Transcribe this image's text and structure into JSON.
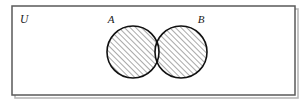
{
  "figure": {
    "type": "venn-diagram",
    "title": "",
    "universe_label": "U",
    "sets": [
      {
        "id": "A",
        "label": "A",
        "shaded": true
      },
      {
        "id": "B",
        "label": "B",
        "shaded": true
      }
    ],
    "regions": {
      "a_only": {
        "name": "A only",
        "shaded": true,
        "fill": "hatch-45"
      },
      "b_only": {
        "name": "B only",
        "shaded": true,
        "fill": "hatch-45"
      },
      "intersection": {
        "name": "A and B",
        "shaded": false,
        "fill": "white"
      },
      "outside": {
        "name": "outside A and B",
        "shaded": false,
        "fill": "white"
      }
    },
    "colors": {
      "background": "#ffffff",
      "border": "#5a5a5a",
      "shadow": "#b0b0b0",
      "outline": "#111111",
      "hatch": "#333333",
      "text": "#1a1a1a"
    },
    "geometry": {
      "frame": {
        "x": 12,
        "y": 6,
        "width": 283,
        "height": 89
      },
      "circle_a": {
        "cx": 133,
        "cy": 52,
        "r": 26
      },
      "circle_b": {
        "cx": 181,
        "cy": 52,
        "r": 26
      },
      "label_a": {
        "x": 111,
        "y": 23
      },
      "label_b": {
        "x": 199,
        "y": 23
      },
      "label_u": {
        "x": 20,
        "y": 22
      }
    }
  }
}
